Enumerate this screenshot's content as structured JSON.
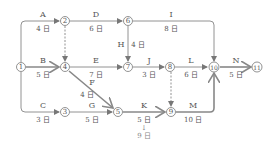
{
  "nodes": [
    {
      "id": "1",
      "label": "1",
      "x": 21,
      "y": 67
    },
    {
      "id": "2",
      "label": "2",
      "x": 65,
      "y": 21
    },
    {
      "id": "3",
      "label": "3",
      "x": 65,
      "y": 112
    },
    {
      "id": "4",
      "label": "4",
      "x": 65,
      "y": 67
    },
    {
      "id": "5",
      "label": "5",
      "x": 118,
      "y": 112
    },
    {
      "id": "6",
      "label": "6",
      "x": 128,
      "y": 21
    },
    {
      "id": "7",
      "label": "7",
      "x": 128,
      "y": 67
    },
    {
      "id": "8",
      "label": "8",
      "x": 170,
      "y": 67
    },
    {
      "id": "9",
      "label": "9",
      "x": 171,
      "y": 112
    },
    {
      "id": "10",
      "label": "10",
      "x": 214,
      "y": 67
    },
    {
      "id": "11",
      "label": "11",
      "x": 257,
      "y": 67
    }
  ],
  "activities": [
    {
      "name": "A",
      "duration": "4 日",
      "from": "1",
      "to": "2"
    },
    {
      "name": "B",
      "duration": "5 日",
      "from": "1",
      "to": "4",
      "critical": true
    },
    {
      "name": "C",
      "duration": "3 日",
      "from": "1",
      "to": "3"
    },
    {
      "name": "D",
      "duration": "6 日",
      "from": "2",
      "to": "6"
    },
    {
      "name": "E",
      "duration": "7 日",
      "from": "4",
      "to": "7"
    },
    {
      "name": "F",
      "duration": "4 日",
      "from": "4",
      "to": "5",
      "critical": true
    },
    {
      "name": "G",
      "duration": "5 日",
      "from": "3",
      "to": "5"
    },
    {
      "name": "H",
      "duration": "4 日",
      "from": "6",
      "to": "7"
    },
    {
      "name": "I",
      "duration": "8 日",
      "from": "6",
      "to": "10"
    },
    {
      "name": "J",
      "duration": "3 日",
      "from": "7",
      "to": "8"
    },
    {
      "name": "K",
      "duration": "5 日",
      "from": "5",
      "to": "9",
      "critical": true
    },
    {
      "name": "L",
      "duration": "6 日",
      "from": "8",
      "to": "10"
    },
    {
      "name": "M",
      "duration": "10 日",
      "from": "9",
      "to": "10",
      "critical": true
    },
    {
      "name": "N",
      "duration": "5 日",
      "from": "10",
      "to": "11",
      "critical": true
    }
  ],
  "dummies": [
    {
      "from": "2",
      "to": "4"
    },
    {
      "from": "8",
      "to": "9"
    }
  ],
  "annotation": {
    "arrow": "↓",
    "text": "9 日",
    "target": "K"
  },
  "colors": {
    "line": "#777777",
    "critical": "#888888",
    "text": "#555555",
    "note": "#999999"
  }
}
